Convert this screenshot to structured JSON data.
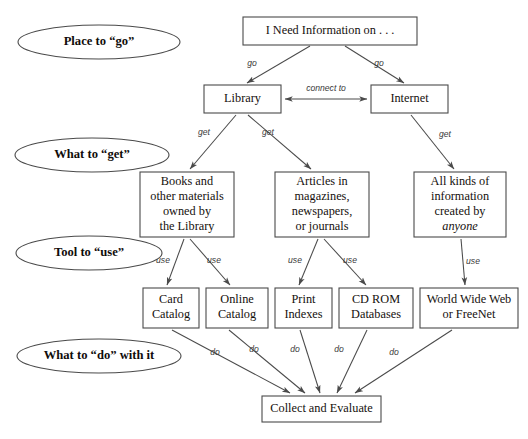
{
  "diagram": {
    "title": "I Need Information on . . .",
    "stage_labels": [
      {
        "id": "stage-place-to-go",
        "text": "Place to “go”",
        "cx": 99,
        "cy": 42,
        "rx": 81,
        "ry": 17
      },
      {
        "id": "stage-what-to-get",
        "text": "What to “get”",
        "cx": 92,
        "cy": 155,
        "rx": 77,
        "ry": 17
      },
      {
        "id": "stage-tool-to-use",
        "text": "Tool to “use”",
        "cx": 89,
        "cy": 253,
        "rx": 73,
        "ry": 17
      },
      {
        "id": "stage-what-to-do",
        "text": "What to “do” with it",
        "cx": 99,
        "cy": 356,
        "rx": 82,
        "ry": 17
      }
    ],
    "nodes": [
      {
        "id": "node-need-information",
        "x": 243,
        "y": 17,
        "w": 174,
        "h": 28,
        "lines": [
          "I Need Information on . . ."
        ],
        "italic_lines": []
      },
      {
        "id": "node-library",
        "x": 204,
        "y": 85,
        "w": 77,
        "h": 28,
        "lines": [
          "Library"
        ],
        "italic_lines": []
      },
      {
        "id": "node-internet",
        "x": 371,
        "y": 85,
        "w": 77,
        "h": 28,
        "lines": [
          "Internet"
        ],
        "italic_lines": []
      },
      {
        "id": "node-books-materials",
        "x": 140,
        "y": 172,
        "w": 94,
        "h": 65,
        "lines": [
          "Books and",
          "other materials",
          "owned by",
          "the Library"
        ],
        "italic_lines": []
      },
      {
        "id": "node-articles",
        "x": 275,
        "y": 172,
        "w": 94,
        "h": 65,
        "lines": [
          "Articles in",
          "magazines,",
          "newspapers,",
          "or journals"
        ],
        "italic_lines": []
      },
      {
        "id": "node-all-kinds-info",
        "x": 414,
        "y": 172,
        "w": 92,
        "h": 65,
        "lines": [
          "All kinds of",
          "information",
          "created by",
          "anyone"
        ],
        "italic_lines": [
          "anyone"
        ]
      },
      {
        "id": "node-card-catalog",
        "x": 143,
        "y": 288,
        "w": 56,
        "h": 40,
        "lines": [
          "Card",
          "Catalog"
        ],
        "italic_lines": []
      },
      {
        "id": "node-online-catalog",
        "x": 206,
        "y": 288,
        "w": 62,
        "h": 40,
        "lines": [
          "Online",
          "Catalog"
        ],
        "italic_lines": []
      },
      {
        "id": "node-print-indexes",
        "x": 275,
        "y": 288,
        "w": 57,
        "h": 40,
        "lines": [
          "Print",
          "Indexes"
        ],
        "italic_lines": []
      },
      {
        "id": "node-cd-rom-databases",
        "x": 339,
        "y": 288,
        "w": 74,
        "h": 40,
        "lines": [
          "CD ROM",
          "Databases"
        ],
        "italic_lines": []
      },
      {
        "id": "node-world-wide-web",
        "x": 420,
        "y": 288,
        "w": 98,
        "h": 40,
        "lines": [
          "World Wide Web",
          "or FreeNet"
        ],
        "italic_lines": []
      },
      {
        "id": "node-collect-evaluate",
        "x": 262,
        "y": 396,
        "w": 119,
        "h": 26,
        "lines": [
          "Collect and Evaluate"
        ],
        "italic_lines": []
      }
    ],
    "edges": [
      {
        "id": "edge-need-to-library",
        "from": "node-need-information",
        "to": "node-library",
        "label": "go",
        "lx": 252,
        "ly": 64,
        "x1": 310,
        "y1": 46,
        "x2": 247,
        "y2": 83
      },
      {
        "id": "edge-need-to-internet",
        "from": "node-need-information",
        "to": "node-internet",
        "label": "go",
        "lx": 379,
        "ly": 64,
        "x1": 345,
        "y1": 46,
        "x2": 404,
        "y2": 83
      },
      {
        "id": "edge-library-internet",
        "from": "node-library",
        "to": "node-internet",
        "label": "connect to",
        "lx": 326,
        "ly": 89,
        "x1": 285,
        "y1": 99,
        "x2": 367,
        "y2": 99
      },
      {
        "id": "edge-library-to-books",
        "from": "node-library",
        "to": "node-books-materials",
        "label": "get",
        "lx": 204,
        "ly": 133,
        "x1": 236,
        "y1": 115,
        "x2": 190,
        "y2": 169
      },
      {
        "id": "edge-library-to-articles",
        "from": "node-library",
        "to": "node-articles",
        "label": "get",
        "lx": 268,
        "ly": 133,
        "x1": 248,
        "y1": 115,
        "x2": 311,
        "y2": 169
      },
      {
        "id": "edge-internet-to-allkinds",
        "from": "node-internet",
        "to": "node-all-kinds-info",
        "label": "get",
        "lx": 445,
        "ly": 135,
        "x1": 411,
        "y1": 115,
        "x2": 454,
        "y2": 169
      },
      {
        "id": "edge-books-to-card",
        "from": "node-books-materials",
        "to": "node-card-catalog",
        "label": "use",
        "lx": 163,
        "ly": 261,
        "x1": 184,
        "y1": 239,
        "x2": 167,
        "y2": 285
      },
      {
        "id": "edge-books-to-online",
        "from": "node-books-materials",
        "to": "node-online-catalog",
        "label": "use",
        "lx": 214,
        "ly": 261,
        "x1": 190,
        "y1": 239,
        "x2": 230,
        "y2": 285
      },
      {
        "id": "edge-articles-to-print",
        "from": "node-articles",
        "to": "node-print-indexes",
        "label": "use",
        "lx": 295,
        "ly": 261,
        "x1": 318,
        "y1": 239,
        "x2": 299,
        "y2": 285
      },
      {
        "id": "edge-articles-to-cdrom",
        "from": "node-articles",
        "to": "node-cd-rom-databases",
        "label": "use",
        "lx": 350,
        "ly": 261,
        "x1": 324,
        "y1": 239,
        "x2": 366,
        "y2": 285
      },
      {
        "id": "edge-allkinds-to-web",
        "from": "node-all-kinds-info",
        "to": "node-world-wide-web",
        "label": "use",
        "lx": 473,
        "ly": 262,
        "x1": 461,
        "y1": 239,
        "x2": 465,
        "y2": 285
      },
      {
        "id": "edge-card-to-collect",
        "from": "node-card-catalog",
        "to": "node-collect-evaluate",
        "label": "do",
        "lx": 215,
        "ly": 353,
        "x1": 172,
        "y1": 330,
        "x2": 290,
        "y2": 393
      },
      {
        "id": "edge-online-to-collect",
        "from": "node-online-catalog",
        "to": "node-collect-evaluate",
        "label": "do",
        "lx": 254,
        "ly": 350,
        "x1": 229,
        "y1": 330,
        "x2": 305,
        "y2": 393
      },
      {
        "id": "edge-print-to-collect",
        "from": "node-print-indexes",
        "to": "node-collect-evaluate",
        "label": "do",
        "lx": 295,
        "ly": 350,
        "x1": 300,
        "y1": 330,
        "x2": 320,
        "y2": 393
      },
      {
        "id": "edge-cdrom-to-collect",
        "from": "node-cd-rom-databases",
        "to": "node-collect-evaluate",
        "label": "do",
        "lx": 339,
        "ly": 350,
        "x1": 367,
        "y1": 330,
        "x2": 337,
        "y2": 393
      },
      {
        "id": "edge-web-to-collect",
        "from": "node-world-wide-web",
        "to": "node-collect-evaluate",
        "label": "do",
        "lx": 394,
        "ly": 353,
        "x1": 452,
        "y1": 330,
        "x2": 355,
        "y2": 393
      }
    ],
    "colors": {
      "stroke": "#4a4a4a",
      "text": "#15100d",
      "edge_label": "#3a3a3a",
      "background": "#ffffff"
    }
  }
}
